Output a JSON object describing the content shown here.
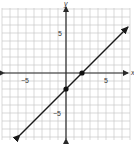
{
  "chart_data": {
    "type": "line",
    "title": "",
    "xlabel": "x",
    "ylabel": "y",
    "xlim": [
      -8,
      8
    ],
    "ylim": [
      -8,
      8
    ],
    "grid": true,
    "x_tick_labels": [
      "-5",
      "5"
    ],
    "y_tick_labels": [
      "5",
      "-5"
    ],
    "series": [
      {
        "name": "y = x - 2",
        "equation": "y = x - 2",
        "slope": 1,
        "intercept": -2,
        "x": [
          -5.75,
          7.75
        ],
        "y": [
          -7.75,
          5.75
        ],
        "arrows_both_ends": true
      }
    ],
    "points": [
      {
        "label": "x-intercept",
        "x": 2,
        "y": 0
      },
      {
        "label": "y-intercept",
        "x": 0,
        "y": -2
      }
    ]
  },
  "labels": {
    "x_axis": "x",
    "y_axis": "y",
    "x_neg5": "−5",
    "x_pos5": "5",
    "y_pos5": "5",
    "y_neg5": "−5"
  },
  "colors": {
    "grid": "#c8c8c8",
    "axis": "#2a2a2a",
    "line": "#1a1a1a",
    "point": "#111111",
    "text": "#333333"
  }
}
